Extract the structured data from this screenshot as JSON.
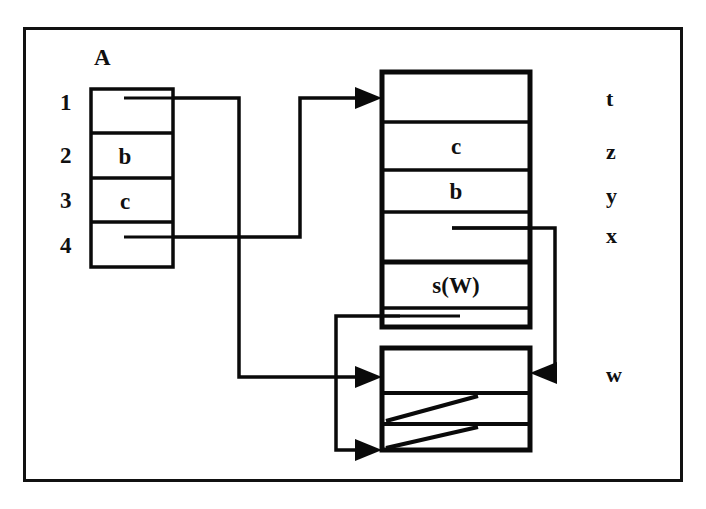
{
  "figure": {
    "background_color": "#ffffff",
    "ink_color": "#0a0a0a"
  },
  "array": {
    "name_label": "A",
    "index_labels": [
      "1",
      "2",
      "3",
      "4"
    ],
    "cells": [
      {
        "index": "1",
        "value": "",
        "has_pointer_stub": true
      },
      {
        "index": "2",
        "value": "b",
        "has_pointer_stub": false
      },
      {
        "index": "3",
        "value": "c",
        "has_pointer_stub": false
      },
      {
        "index": "4",
        "value": "",
        "has_pointer_stub": true
      }
    ]
  },
  "upper_record": {
    "name": "upper-record-block",
    "cells": [
      {
        "value": "",
        "has_pointer_stub": false
      },
      {
        "value": "c",
        "has_pointer_stub": false
      },
      {
        "value": "b",
        "has_pointer_stub": false
      },
      {
        "value": "",
        "has_pointer_stub": true
      },
      {
        "value": "s(W)",
        "has_pointer_stub": false
      },
      {
        "value": "",
        "has_pointer_stub": true
      }
    ]
  },
  "lower_record": {
    "name": "lower-record-block",
    "cells": [
      {
        "value": "",
        "has_pointer_stub": false,
        "is_null": false
      },
      {
        "value": "",
        "has_pointer_stub": false,
        "is_null": true
      },
      {
        "value": "",
        "has_pointer_stub": false,
        "is_null": true
      }
    ]
  },
  "variable_labels": [
    {
      "name": "t",
      "target": "upper-record-cell-1"
    },
    {
      "name": "z",
      "target": "upper-record-cell-2"
    },
    {
      "name": "y",
      "target": "upper-record-cell-3"
    },
    {
      "name": "x",
      "target": "upper-record-cell-4"
    },
    {
      "name": "w",
      "target": "lower-record-cell-1"
    }
  ],
  "pointers": [
    {
      "id": "a4-to-upper",
      "from": "array-cell-4",
      "to": "upper-record-block",
      "arrow": "right"
    },
    {
      "id": "a1-to-lower",
      "from": "array-cell-1",
      "to": "lower-record-block",
      "arrow": "right"
    },
    {
      "id": "upper6-to-lower3",
      "from": "upper-record-cell-6",
      "to": "lower-record-cell-3",
      "arrow": "right"
    },
    {
      "id": "upper4-to-lower1",
      "from": "upper-record-cell-4",
      "to": "lower-record-cell-1",
      "arrow": "left"
    }
  ]
}
